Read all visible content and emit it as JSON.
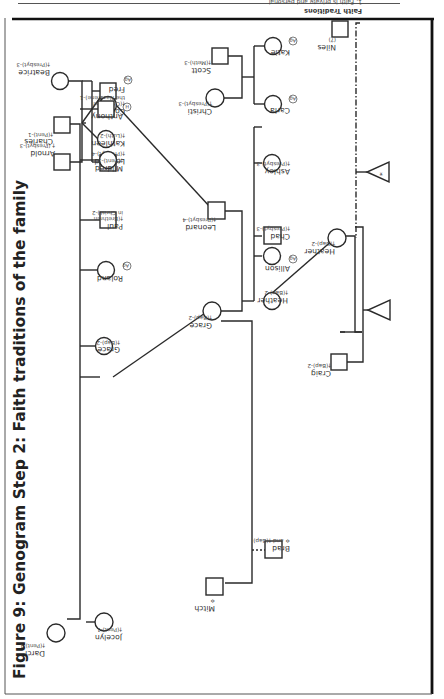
{
  "figure": {
    "title": "Figure 9: Genogram Step 2: Faith traditions of the family",
    "orientation": "rotated 90° counter-clockwise"
  },
  "people": {
    "arnold": {
      "name": "Arnold",
      "faith": "† (Presbyt)-3"
    },
    "beatrice": {
      "name": "Beatrice",
      "faith": "†(Presbyt)-3"
    },
    "fred": {
      "name": "Fred",
      "badge": "Ag"
    },
    "coleen": {
      "name": "Coleen",
      "faith_lines": [
        "†(Church of",
        "the Nazarene)-1"
      ]
    },
    "kathleen": {
      "name": "Kathleen",
      "faith": "†(Luth)-2"
    },
    "leonard_gen1": {
      "name": "Leonard",
      "faith": "†(Presbyt)-4"
    },
    "leonard_gen2": {
      "name": "Leonard",
      "faith": "†(Presbyt)-4"
    },
    "charles": {
      "name": "Charles",
      "faith": "†(Pent)-1"
    },
    "darci": {
      "name": "Darci",
      "faith": "†(Pent)-1"
    },
    "anthony": {
      "name": "Anthony",
      "badge": "H"
    },
    "mildred": {
      "name": "Mildred",
      "faith": "†(Pent)-1"
    },
    "paul": {
      "name": "Paul",
      "faith_lines": [
        "†(Brethren",
        "in Christ)-2"
      ]
    },
    "roland": {
      "name": "Roland",
      "badge": "Ag"
    },
    "grace_gen1": {
      "name": "Grace",
      "faith": "†(Bap)-2"
    },
    "jocelyn": {
      "name": "Jocelyn",
      "faith": "†(Pent)-1"
    },
    "grace_gen2": {
      "name": "Grace",
      "faith": "†(Bap)-2"
    },
    "mitch": {
      "name": "Mitch",
      "faith": "✡"
    },
    "brad": {
      "name": "Brad",
      "faith": "✡ and †(Bap)"
    },
    "scott": {
      "name": "Scott",
      "faith": "†(Meth)-3"
    },
    "christi": {
      "name": "Christi",
      "faith": "†(Presbyt)-3"
    },
    "katie": {
      "name": "Katie",
      "badge": "Ag"
    },
    "carla": {
      "name": "Carla",
      "badge": "Ag"
    },
    "ashley": {
      "name": "Ashley",
      "faith": "†(Presbyt)-3"
    },
    "chad": {
      "name": "Chad",
      "faith": "†(Presbyt)-3"
    },
    "allison": {
      "name": "Allison",
      "badge": "Ag"
    },
    "heather_gen1": {
      "name": "Heather",
      "faith": "†(Bap)-2"
    },
    "heather_gen2": {
      "name": "Heather",
      "faith": "†(Bap)-2"
    },
    "craig": {
      "name": "Craig",
      "faith": "†(Bap)-2"
    },
    "niles": {
      "name": "Niles",
      "faith": "(?)"
    }
  },
  "pregnancies": [
    {
      "id": "pregnancy-craig-heather",
      "marker": ""
    },
    {
      "id": "pregnancy-niles-heather",
      "marker": "*"
    }
  ],
  "legend": {
    "title": "Faith Traditions",
    "items": [
      {
        "num": "1.",
        "lines": [
          "Faith is private and personal"
        ]
      },
      {
        "num": "2.",
        "lines": [
          "Value obeying authority and being",
          "a good citizen"
        ]
      },
      {
        "num": "3.",
        "lines": [
          "Religious worship and participation",
          "not a big part of family life"
        ]
      },
      {
        "num": "4.",
        "lines": [
          "Image of God as judgmental"
        ]
      }
    ]
  },
  "colors": {
    "line": "#2a2a2a",
    "text": "#333333",
    "frame": "#1a1a1a",
    "background": "#ffffff"
  }
}
